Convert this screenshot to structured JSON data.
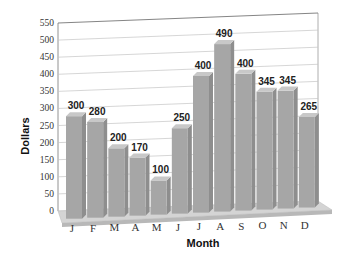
{
  "chart_data": {
    "type": "bar",
    "title": "",
    "xlabel": "Month",
    "ylabel": "Dollars",
    "categories": [
      "J",
      "F",
      "M",
      "A",
      "M",
      "J",
      "J",
      "A",
      "S",
      "O",
      "N",
      "D"
    ],
    "values": [
      300,
      280,
      200,
      170,
      100,
      250,
      400,
      490,
      400,
      345,
      345,
      265
    ],
    "ylim": [
      0,
      550
    ],
    "yticks": [
      0,
      50,
      100,
      150,
      200,
      250,
      300,
      350,
      400,
      450,
      500,
      550
    ],
    "grid": true,
    "style": "3d",
    "bar_color": "#a6a6a6",
    "bar_top_color": "#c8c8c8",
    "floor_color": "#cfcfcf"
  }
}
